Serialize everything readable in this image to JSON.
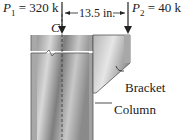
{
  "diagram": {
    "loads": {
      "p1": {
        "symbol": "P",
        "subscript": "1",
        "value": "= 320 k"
      },
      "p2": {
        "symbol": "P",
        "subscript": "2",
        "value": "= 40 k"
      }
    },
    "dimension": "13.5 in.",
    "centroid_label": "C",
    "labels": {
      "bracket": "Bracket",
      "column": "Column"
    }
  }
}
